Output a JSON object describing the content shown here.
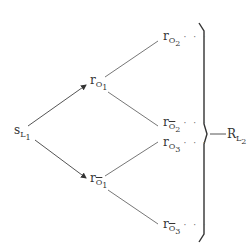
{
  "diagram": {
    "type": "tree",
    "root": {
      "main": "s",
      "sub": "L",
      "subsub": "1"
    },
    "level1": [
      {
        "main": "r",
        "sub": "O",
        "subsub": "1",
        "negated": false
      },
      {
        "main": "r",
        "sub": "O",
        "subsub": "1",
        "negated": true
      }
    ],
    "level2": [
      {
        "main": "r",
        "sub": "O",
        "subsub": "2",
        "negated": false,
        "trailing": "· · ·"
      },
      {
        "main": "r",
        "sub": "O",
        "subsub": "2",
        "negated": true,
        "trailing": "· · ·"
      },
      {
        "main": "r",
        "sub": "O",
        "subsub": "3",
        "negated": false,
        "trailing": "· · ·"
      },
      {
        "main": "r",
        "sub": "O",
        "subsub": "3",
        "negated": true,
        "trailing": "· · ·"
      }
    ],
    "result": {
      "main": "R",
      "sub": "L",
      "subsub": "2"
    }
  }
}
